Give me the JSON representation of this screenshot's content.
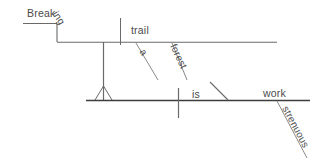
{
  "diagram": {
    "type": "reed-kellogg-sentence-diagram",
    "sentence": "Breaking a forest trail is strenuous work.",
    "ink_color": "#5a5a5a",
    "baseline_color": "#3d3d3d",
    "background": "#ffffff",
    "words": {
      "gerund_stem": "Break",
      "gerund_suffix": "ing",
      "direct_object": "trail",
      "article": "a",
      "noun_modifier": "forest",
      "verb": "is",
      "predicate_noun": "work",
      "adjective": "strenuous"
    },
    "parts": [
      {
        "label": "Break",
        "role": "gerund-stem-on-upper-step"
      },
      {
        "label": "ing",
        "role": "gerund-suffix-on-diagonal-step"
      },
      {
        "label": "trail",
        "role": "direct-object-of-gerund"
      },
      {
        "label": "a",
        "role": "article-modifying-trail"
      },
      {
        "label": "forest",
        "role": "adjective-modifying-trail"
      },
      {
        "label": "is",
        "role": "linking-verb"
      },
      {
        "label": "work",
        "role": "predicate-nominative"
      },
      {
        "label": "strenuous",
        "role": "adjective-modifying-work"
      }
    ],
    "lines": {
      "gerund_upper_step": "horizontal line carrying 'Break'",
      "gerund_lower_line": "horizontal line carrying 'ing' step and 'trail'",
      "object_divider": "short vertical bar between gerund and 'trail'",
      "pedestal": "vertical stilt with triangle base seating the gerund phrase on the main baseline",
      "main_baseline": "thick horizontal baseline carrying subject, 'is' and 'work'",
      "subject_verb_divider": "vertical bar crossing the baseline before 'is'",
      "predicate_nominative_slant": "backslash leaning right before 'work'",
      "modifier_slants": "diagonal lines under 'trail' and 'work'"
    }
  }
}
